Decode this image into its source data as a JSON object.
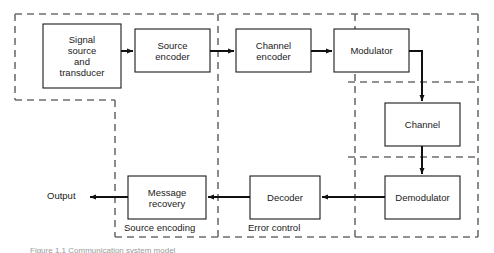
{
  "diagram": {
    "colors": {
      "box_stroke": "#1a1a1a",
      "arrow": "#111111",
      "dashed_zone": "#6e6e6e",
      "background": "#ffffff",
      "text": "#1a1a1a",
      "caption": "#9a9a9a"
    },
    "blocks": [
      {
        "id": "signal-source",
        "label": "Signal\nsource\nand\ntransducer",
        "x": 43,
        "y": 24,
        "w": 78,
        "h": 64
      },
      {
        "id": "source-encoder",
        "label": "Source\nencoder",
        "x": 135,
        "y": 29,
        "w": 75,
        "h": 43
      },
      {
        "id": "channel-encoder",
        "label": "Channel\nencoder",
        "x": 236,
        "y": 29,
        "w": 75,
        "h": 43
      },
      {
        "id": "modulator",
        "label": "Modulator",
        "x": 334,
        "y": 29,
        "w": 75,
        "h": 43
      },
      {
        "id": "channel",
        "label": "Channel",
        "x": 385,
        "y": 103,
        "w": 75,
        "h": 43
      },
      {
        "id": "demodulator",
        "label": "Demodulator",
        "x": 385,
        "y": 176,
        "w": 75,
        "h": 43
      },
      {
        "id": "decoder",
        "label": "Decoder",
        "x": 250,
        "y": 176,
        "w": 70,
        "h": 43
      },
      {
        "id": "message-recovery",
        "label": "Message\nrecovery",
        "x": 128,
        "y": 176,
        "w": 78,
        "h": 43
      }
    ],
    "zone_labels": [
      {
        "id": "source-encoding",
        "text": "Source encoding",
        "x": 124,
        "y": 222
      },
      {
        "id": "error-control",
        "text": "Error control",
        "x": 248,
        "y": 222
      }
    ],
    "io_labels": [
      {
        "id": "output",
        "text": "Output",
        "x": 47,
        "y": 190
      }
    ],
    "caption": "Figure 1.1  Communication system model"
  }
}
